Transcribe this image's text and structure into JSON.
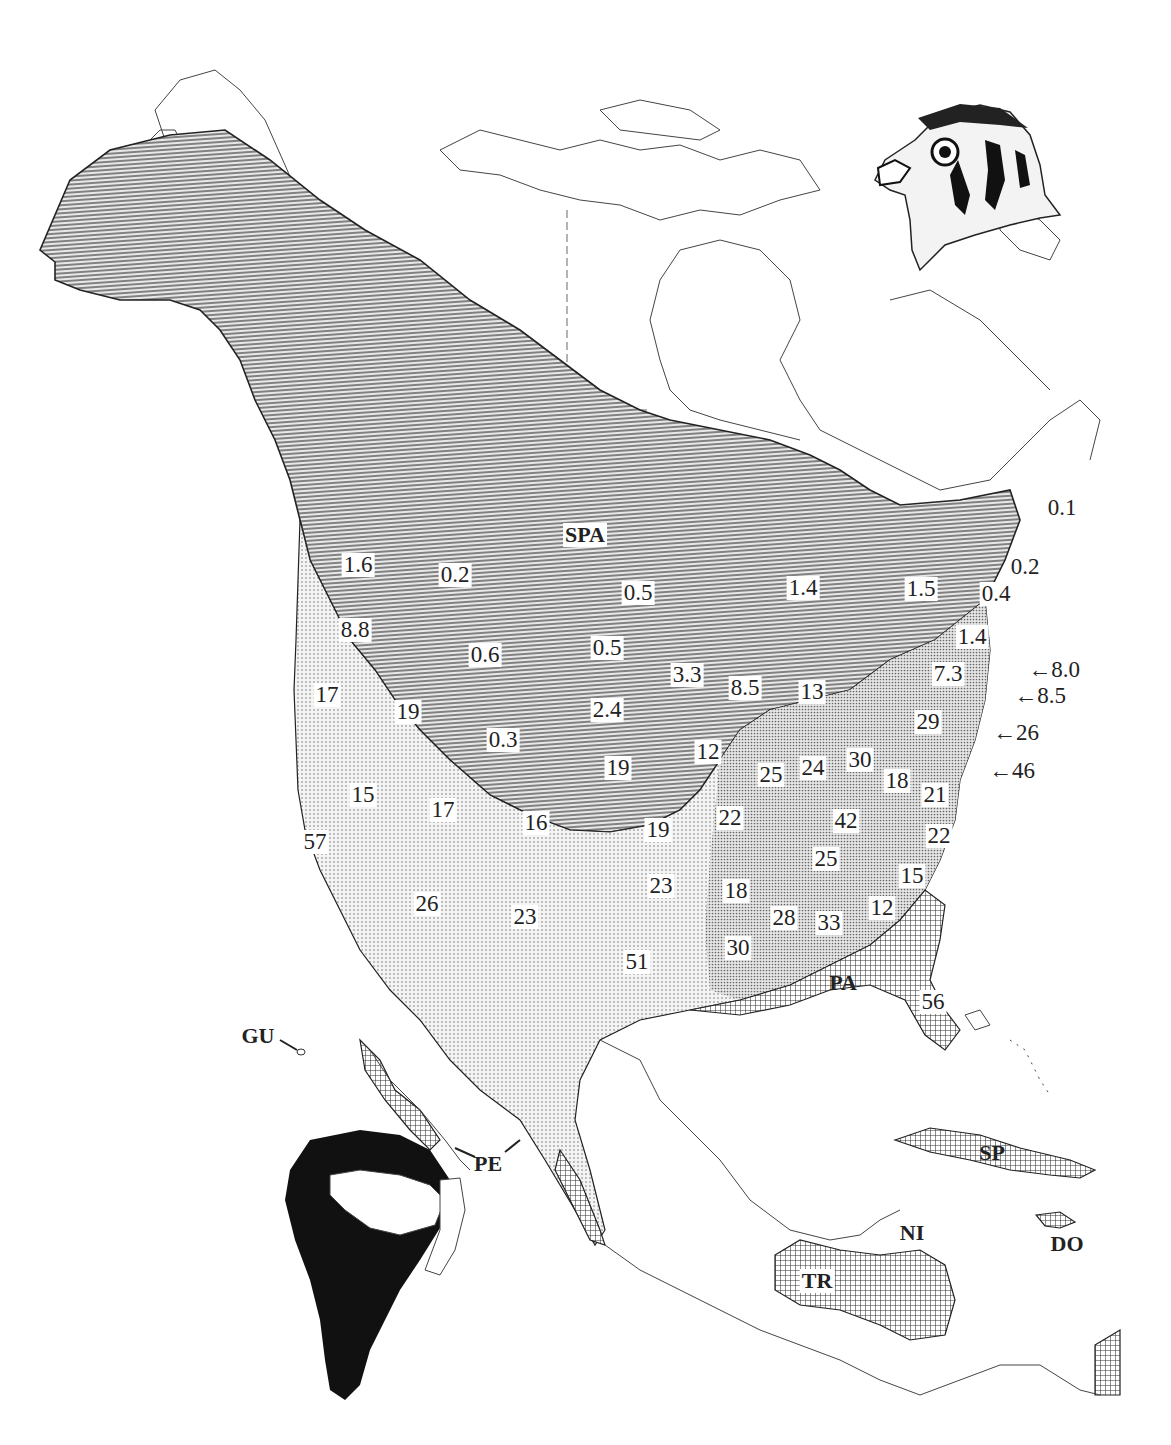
{
  "map": {
    "subject": "American Kestrel distribution map",
    "legend_patterns": {
      "breeding_range": "horizontal-lines",
      "year_round_range": "fine-dots",
      "winter_range": "crosshatch",
      "south_america_range": "solid-black"
    },
    "colors": {
      "ink": "#222222",
      "background": "#ffffff",
      "shade_lines": "#555555"
    },
    "subspecies_labels": [
      {
        "code": "SPA",
        "x": 585,
        "y": 535
      },
      {
        "code": "PA",
        "x": 843,
        "y": 983
      },
      {
        "code": "PE",
        "x": 488,
        "y": 1164
      },
      {
        "code": "GU",
        "x": 258,
        "y": 1036
      },
      {
        "code": "SP",
        "x": 992,
        "y": 1153
      },
      {
        "code": "NI",
        "x": 912,
        "y": 1233
      },
      {
        "code": "DO",
        "x": 1067,
        "y": 1244
      },
      {
        "code": "TR",
        "x": 817,
        "y": 1281
      }
    ],
    "region_values": [
      {
        "value": "1.6",
        "x": 358,
        "y": 565
      },
      {
        "value": "0.2",
        "x": 455,
        "y": 575
      },
      {
        "value": "0.5",
        "x": 638,
        "y": 593
      },
      {
        "value": "8.8",
        "x": 355,
        "y": 630
      },
      {
        "value": "0.6",
        "x": 485,
        "y": 655
      },
      {
        "value": "0.5",
        "x": 607,
        "y": 648
      },
      {
        "value": "3.3",
        "x": 687,
        "y": 675
      },
      {
        "value": "1.4",
        "x": 803,
        "y": 588
      },
      {
        "value": "1.5",
        "x": 921,
        "y": 589
      },
      {
        "value": "0.2",
        "x": 1025,
        "y": 567
      },
      {
        "value": "0.4",
        "x": 996,
        "y": 594
      },
      {
        "value": "0.1",
        "x": 1062,
        "y": 508
      },
      {
        "value": "1.4",
        "x": 972,
        "y": 637
      },
      {
        "value": "7.3",
        "x": 948,
        "y": 674
      },
      {
        "value": "8.5",
        "x": 745,
        "y": 688
      },
      {
        "value": "13",
        "x": 812,
        "y": 692
      },
      {
        "value": "17",
        "x": 327,
        "y": 695
      },
      {
        "value": "19",
        "x": 408,
        "y": 712
      },
      {
        "value": "2.4",
        "x": 607,
        "y": 710
      },
      {
        "value": "0.3",
        "x": 503,
        "y": 740
      },
      {
        "value": "29",
        "x": 928,
        "y": 722
      },
      {
        "value": "12",
        "x": 708,
        "y": 752
      },
      {
        "value": "19",
        "x": 618,
        "y": 768
      },
      {
        "value": "25",
        "x": 771,
        "y": 775
      },
      {
        "value": "24",
        "x": 813,
        "y": 768
      },
      {
        "value": "30",
        "x": 860,
        "y": 760
      },
      {
        "value": "18",
        "x": 897,
        "y": 781
      },
      {
        "value": "21",
        "x": 935,
        "y": 795
      },
      {
        "value": "15",
        "x": 363,
        "y": 795
      },
      {
        "value": "17",
        "x": 443,
        "y": 810
      },
      {
        "value": "16",
        "x": 536,
        "y": 823
      },
      {
        "value": "19",
        "x": 658,
        "y": 830
      },
      {
        "value": "22",
        "x": 730,
        "y": 818
      },
      {
        "value": "42",
        "x": 846,
        "y": 821
      },
      {
        "value": "22",
        "x": 939,
        "y": 836
      },
      {
        "value": "57",
        "x": 315,
        "y": 842
      },
      {
        "value": "25",
        "x": 826,
        "y": 859
      },
      {
        "value": "15",
        "x": 912,
        "y": 876
      },
      {
        "value": "23",
        "x": 661,
        "y": 886
      },
      {
        "value": "18",
        "x": 736,
        "y": 891
      },
      {
        "value": "26",
        "x": 427,
        "y": 904
      },
      {
        "value": "23",
        "x": 525,
        "y": 917
      },
      {
        "value": "28",
        "x": 784,
        "y": 918
      },
      {
        "value": "33",
        "x": 829,
        "y": 923
      },
      {
        "value": "12",
        "x": 882,
        "y": 908
      },
      {
        "value": "51",
        "x": 637,
        "y": 962
      },
      {
        "value": "30",
        "x": 738,
        "y": 948
      },
      {
        "value": "56",
        "x": 933,
        "y": 1002
      }
    ],
    "coastal_callouts": [
      {
        "value": "8.0",
        "x": 1054,
        "y": 670
      },
      {
        "value": "8.5",
        "x": 1040,
        "y": 696
      },
      {
        "value": "26",
        "x": 1016,
        "y": 733
      },
      {
        "value": "46",
        "x": 1012,
        "y": 771
      }
    ],
    "illustration": "kestrel-head-drawing",
    "inset": "south-america-range-inset"
  }
}
